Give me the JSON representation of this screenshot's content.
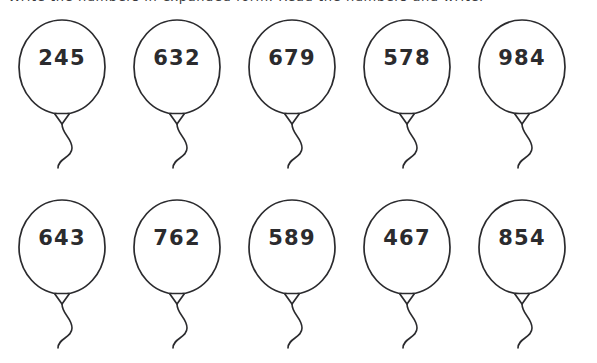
{
  "page": {
    "type": "math-worksheet",
    "background_color": "#ffffff",
    "ink_color": "#2b2b2e",
    "header_clipped_text": "Write the numbers in expanded form. Read the numbers and write."
  },
  "balloons": {
    "shape_name": "balloon-with-string",
    "rows": [
      {
        "row_name": "top-row",
        "items": [
          {
            "value": "245"
          },
          {
            "value": "632"
          },
          {
            "value": "679"
          },
          {
            "value": "578"
          },
          {
            "value": "984"
          }
        ]
      },
      {
        "row_name": "bottom-row",
        "items": [
          {
            "value": "643"
          },
          {
            "value": "762"
          },
          {
            "value": "589"
          },
          {
            "value": "467"
          },
          {
            "value": "854"
          }
        ]
      }
    ]
  }
}
